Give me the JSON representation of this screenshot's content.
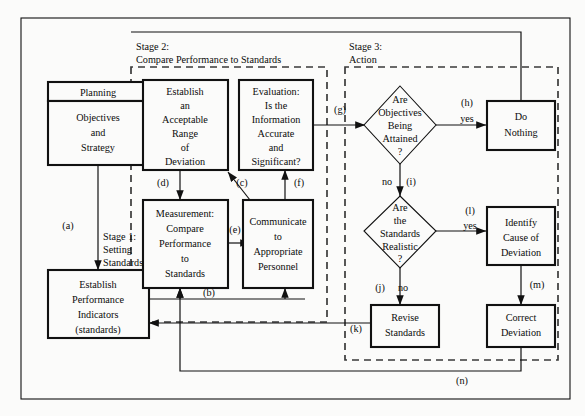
{
  "figure": {
    "colors": {
      "background": "#fbfbfa",
      "stroke": "#111111",
      "dashed_stroke": "#3a3a3a",
      "shadow": "#9a9a9a"
    }
  },
  "stages": [
    {
      "id": "stage1",
      "line1": "Stage 1:",
      "line2": "Setting",
      "line3": "Standards"
    },
    {
      "id": "stage2",
      "line1": "Stage 2:",
      "line2": "Compare Performance to Standards"
    },
    {
      "id": "stage3",
      "line1": "Stage 3:",
      "line2": "Action"
    }
  ],
  "boxes": {
    "planning": {
      "header": "Planning",
      "body": [
        "Objectives",
        "and",
        "Strategy"
      ]
    },
    "establish_indicators": {
      "body": [
        "Establish",
        "Performance",
        "Indicators",
        "(standards)"
      ]
    },
    "acceptable_range": {
      "body": [
        "Establish",
        "an",
        "Acceptable",
        "Range",
        "of",
        "Deviation"
      ]
    },
    "measurement": {
      "body": [
        "Measurement:",
        "Compare",
        "Performance",
        "to",
        "Standards"
      ]
    },
    "evaluation": {
      "body": [
        "Evaluation:",
        "Is the",
        "Information",
        "Accurate",
        "and",
        "Significant?"
      ]
    },
    "communicate": {
      "body": [
        "Communicate",
        "to",
        "Appropriate",
        "Personnel"
      ]
    },
    "do_nothing": {
      "body": [
        "Do",
        "Nothing"
      ]
    },
    "identify_cause": {
      "body": [
        "Identify",
        "Cause of",
        "Deviation"
      ]
    },
    "revise_standards": {
      "body": [
        "Revise",
        "Standards"
      ]
    },
    "correct_deviation": {
      "body": [
        "Correct",
        "Deviation"
      ]
    }
  },
  "decisions": {
    "objectives_attained": {
      "body": [
        "Are",
        "Objectives",
        "Being",
        "Attained",
        "?"
      ]
    },
    "standards_realistic": {
      "body": [
        "Are",
        "the",
        "Standards",
        "Realistic",
        "?"
      ]
    }
  },
  "edge_labels": {
    "a": "(a)",
    "b": "(b)",
    "c": "(c)",
    "d": "(d)",
    "e": "(e)",
    "f": "(f)",
    "g": "(g)",
    "h": "(h)",
    "i": "(i)",
    "j": "(j)",
    "k": "(k)",
    "l": "(l)",
    "m": "(m)",
    "n": "(n)"
  },
  "branch_labels": {
    "h_yes": "yes",
    "i_no": "no",
    "j_no": "no",
    "l_yes": "yes"
  }
}
